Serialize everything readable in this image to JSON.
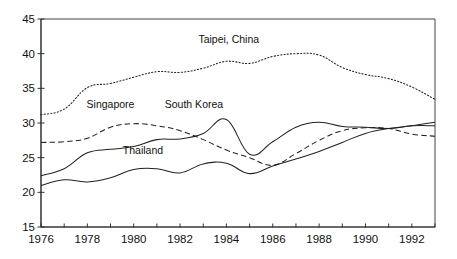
{
  "chart_data": {
    "type": "line",
    "title": "",
    "subtitle": "",
    "xlabel": "",
    "ylabel": "",
    "xlim": [
      1976,
      1993
    ],
    "ylim": [
      15,
      45
    ],
    "grid": false,
    "legend_position": "inline-annotations",
    "y_ticks": [
      15,
      20,
      25,
      30,
      35,
      40,
      45
    ],
    "y_tick_labels": [
      "15",
      "20",
      "25",
      "30",
      "35",
      "40",
      "45"
    ],
    "x_ticks": [
      1976,
      1977,
      1978,
      1979,
      1980,
      1981,
      1982,
      1983,
      1984,
      1985,
      1986,
      1987,
      1988,
      1989,
      1990,
      1991,
      1992,
      1993
    ],
    "x_tick_labels_shown": [
      "1976",
      "1978",
      "1980",
      "1982",
      "1984",
      "1986",
      "1988",
      "1990",
      "1992"
    ],
    "x": [
      1976,
      1977,
      1978,
      1979,
      1980,
      1981,
      1982,
      1983,
      1984,
      1985,
      1986,
      1987,
      1988,
      1989,
      1990,
      1991,
      1992,
      1993
    ],
    "series": [
      {
        "name": "Taipei, China",
        "style": "dotted",
        "color": "#222222",
        "label_x": 1984.1,
        "label_y": 41.6,
        "values": [
          31.2,
          32.0,
          35.1,
          35.7,
          36.6,
          37.4,
          37.3,
          37.9,
          38.9,
          38.6,
          39.6,
          40.0,
          39.8,
          38.0,
          37.0,
          36.4,
          35.2,
          33.4
        ]
      },
      {
        "name": "Singapore",
        "style": "dashed",
        "color": "#222222",
        "label_x": 1979.0,
        "label_y": 32.1,
        "values": [
          27.2,
          27.3,
          27.8,
          29.4,
          29.9,
          29.6,
          28.9,
          27.6,
          26.1,
          25.0,
          23.9,
          25.6,
          27.5,
          28.9,
          29.3,
          29.2,
          28.4,
          28.1
        ]
      },
      {
        "name": "South Korea",
        "style": "solid",
        "color": "#222222",
        "label_x": 1982.6,
        "label_y": 32.1,
        "values": [
          22.4,
          23.4,
          25.7,
          26.2,
          26.6,
          27.6,
          27.7,
          28.5,
          30.5,
          25.5,
          27.3,
          29.4,
          30.1,
          29.5,
          29.4,
          29.2,
          29.6,
          29.6
        ]
      },
      {
        "name": "Thailand",
        "style": "solid",
        "color": "#222222",
        "label_x": 1980.4,
        "label_y": 25.6,
        "values": [
          21.0,
          21.8,
          21.5,
          22.1,
          23.3,
          23.4,
          22.8,
          24.1,
          24.2,
          22.7,
          23.8,
          24.8,
          25.9,
          27.2,
          28.5,
          29.2,
          29.6,
          30.1
        ]
      }
    ]
  },
  "figure": {
    "background_color": "#ffffff",
    "axis_color": "#333333"
  }
}
